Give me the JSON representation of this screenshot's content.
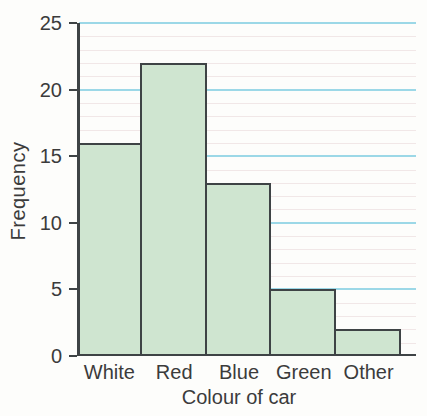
{
  "chart_data": {
    "type": "bar",
    "categories": [
      "White",
      "Red",
      "Blue",
      "Green",
      "Other"
    ],
    "values": [
      16,
      22,
      13,
      5,
      2
    ],
    "title": "",
    "xlabel": "Colour of car",
    "ylabel": "Frequency",
    "ylim": [
      0,
      25
    ],
    "yticks": [
      0,
      5,
      10,
      15,
      20,
      25
    ],
    "grid": {
      "major_interval": 5,
      "minor_interval": 1,
      "major_color": "#9cd8e7",
      "minor_color": "#f1e7e7"
    },
    "legend": "none",
    "bars_adjacent": true,
    "colors": {
      "bar_fill": "#cfe5d0",
      "bar_border": "#3e4345",
      "axis": "#3e4345",
      "text": "#3b3b3b",
      "background": "#fdfdfb"
    }
  }
}
